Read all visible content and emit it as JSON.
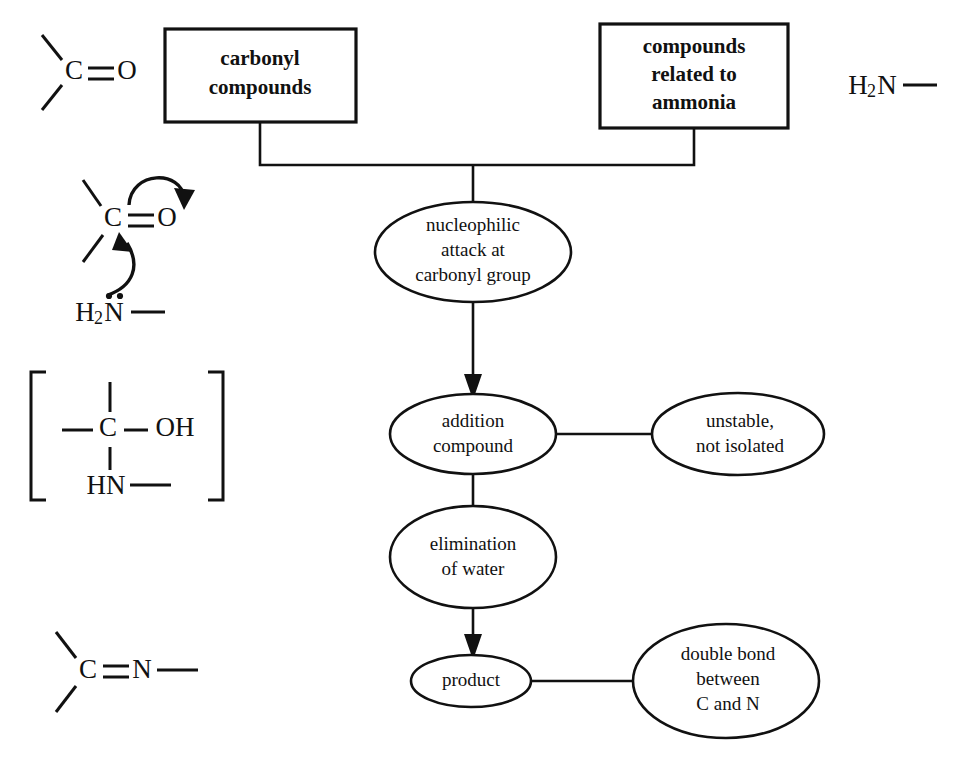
{
  "diagram": {
    "colors": {
      "background": "#ffffff",
      "stroke": "#111111",
      "fill": "#ffffff"
    },
    "boxes": [
      {
        "id": "carbonyl-compounds",
        "lines": [
          "carbonyl",
          "compounds"
        ],
        "x": 165,
        "y": 29,
        "w": 191,
        "h": 93
      },
      {
        "id": "compounds-related-to-ammonia",
        "lines": [
          "compounds",
          "related to",
          "ammonia"
        ],
        "x": 600,
        "y": 24,
        "w": 188,
        "h": 104
      }
    ],
    "ellipses": [
      {
        "id": "nucleophilic-attack",
        "lines": [
          "nucleophilic",
          "attack at",
          "carbonyl group"
        ],
        "cx": 473,
        "cy": 252,
        "rx": 98,
        "ry": 50
      },
      {
        "id": "addition-compound",
        "lines": [
          "addition",
          "compound"
        ],
        "cx": 473,
        "cy": 434,
        "rx": 83,
        "ry": 40
      },
      {
        "id": "unstable-not-isolated",
        "lines": [
          "unstable,",
          "not isolated"
        ],
        "cx": 738,
        "cy": 434,
        "rx": 86,
        "ry": 41
      },
      {
        "id": "elimination-of-water",
        "lines": [
          "elimination",
          "of water"
        ],
        "cx": 473,
        "cy": 557,
        "rx": 83,
        "ry": 51
      },
      {
        "id": "product",
        "lines": [
          "product"
        ],
        "cx": 471,
        "cy": 681,
        "rx": 60,
        "ry": 26
      },
      {
        "id": "double-bond-c-n",
        "lines": [
          "double bond",
          "between",
          "C and N"
        ],
        "cx": 726,
        "cy": 681,
        "rx": 93,
        "ry": 57
      }
    ],
    "structures": {
      "carbonyl_top": {
        "id": "structure-carbonyl",
        "atoms": [
          "C",
          "O"
        ],
        "bond": "double",
        "description": "C=O carbonyl group"
      },
      "nucleophilic_attack": {
        "id": "structure-nucleophilic-attack",
        "atoms": [
          "C",
          "O",
          "N"
        ],
        "formula": "H2N",
        "subscript": "2",
        "lone_pair": true,
        "arrows": [
          "curved arrow from C=O bond to O",
          "curved arrow from N lone pair to C"
        ],
        "description": "Nucleophilic attack of amine nitrogen on carbonyl carbon"
      },
      "addition_intermediate": {
        "id": "structure-addition-intermediate",
        "atoms": [
          "C",
          "OH",
          "HN"
        ],
        "brackets": true,
        "description": "Bracketed tetrahedral addition compound with C, OH and HN"
      },
      "imine_product": {
        "id": "structure-imine",
        "atoms": [
          "C",
          "N"
        ],
        "bond": "double",
        "description": "C=N imine double bond"
      },
      "amine_reagent": {
        "id": "structure-amine-reagent",
        "formula": "H2N",
        "subscript": "2",
        "description": "H2N- amine reagent"
      }
    },
    "connectors": [
      {
        "id": "box-join-to-nucleophilic",
        "type": "tree"
      },
      {
        "id": "nucleophilic-to-addition",
        "type": "arrow"
      },
      {
        "id": "addition-to-unstable",
        "type": "line"
      },
      {
        "id": "addition-to-elimination",
        "type": "line"
      },
      {
        "id": "elimination-to-product",
        "type": "arrow"
      },
      {
        "id": "product-to-double-bond",
        "type": "line"
      }
    ]
  }
}
